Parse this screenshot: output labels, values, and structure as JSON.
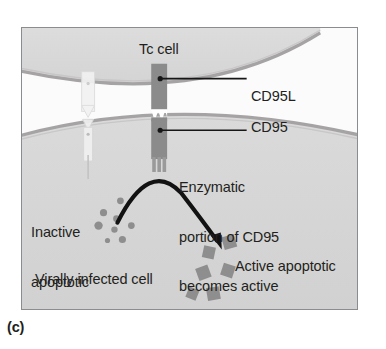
{
  "figure": {
    "caption": "(c)",
    "panel_label": "(c)",
    "labels": {
      "tc_cell": "Tc cell",
      "cd95l": "CD95L",
      "cd95": "CD95",
      "enzymatic_line1": "Enzymatic",
      "enzymatic_line2": "portion of CD95",
      "enzymatic_line3": "becomes active",
      "inactive_line1": "Inactive",
      "inactive_line2": "apoptotic",
      "inactive_line3": "enzymes",
      "active_line1": "Active apoptotic",
      "active_line2": "enzymes induce",
      "active_line3": "apoptosis",
      "virally_infected_cell": "Virally infected cell"
    },
    "colors": {
      "frame_border": "#8a8c8f",
      "background": "#ffffff",
      "cell_fill": "#dcdcdc",
      "cell_membrane": "#a8a5a6",
      "receptor_fill": "#8d8d8d",
      "receptor_dark": "#7d7d7d",
      "enzyme_gray": "#8e8e8e",
      "arrow_black": "#111111",
      "text": "#231f20"
    },
    "diagram": {
      "type": "biology-cell-signaling",
      "cells": [
        {
          "name": "Tc cell",
          "position": "top",
          "description": "upper cell with convex membrane bulging downward"
        },
        {
          "name": "Virally infected cell",
          "position": "bottom",
          "description": "lower cell with convex membrane bulging upward"
        }
      ],
      "receptor_complex": {
        "ligand": "CD95L",
        "receptor": "CD95",
        "binding_interface": "zigzag",
        "enzymatic_prongs": 3
      },
      "inactive_enzymes": {
        "shape": "circle",
        "count": 8,
        "label": "Inactive apoptotic enzymes"
      },
      "active_enzymes": {
        "shape": "square",
        "count": 6,
        "label": "Active apoptotic enzymes induce apoptosis"
      },
      "arrow": {
        "style": "curved",
        "from": "inactive enzyme pool",
        "to": "active enzyme pool"
      }
    }
  }
}
